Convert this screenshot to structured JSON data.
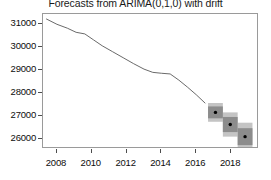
{
  "chart_data": {
    "type": "line",
    "title": "Forecasts from ARIMA(0,1,0) with drift",
    "xlabel": "",
    "ylabel": "",
    "xlim": [
      2007.2,
      2019.6
    ],
    "ylim": [
      25550,
      31450
    ],
    "grid": false,
    "legend": null,
    "xticks": [
      2008,
      2010,
      2012,
      2014,
      2016,
      2018
    ],
    "xtick_labels": [
      "2008",
      "2010",
      "2012",
      "2014",
      "2016",
      "2018"
    ],
    "yticks": [
      26000,
      27000,
      28000,
      29000,
      30000,
      31000
    ],
    "ytick_labels": [
      "26000",
      "27000",
      "28000",
      "29000",
      "30000",
      "31000"
    ],
    "series": [
      {
        "name": "historical",
        "type": "line",
        "color": "#595959",
        "x": [
          2007.4,
          2008.0,
          2008.6,
          2009.1,
          2009.6,
          2010.1,
          2010.6,
          2011.2,
          2011.8,
          2012.4,
          2013.0,
          2013.5,
          2014.0,
          2014.5,
          2015.0,
          2015.5,
          2016.0,
          2016.5
        ],
        "y": [
          31230,
          31000,
          30830,
          30650,
          30580,
          30320,
          30060,
          29800,
          29540,
          29280,
          29040,
          28900,
          28860,
          28830,
          28560,
          28250,
          27920,
          27560
        ]
      },
      {
        "name": "point-forecast",
        "type": "scatter",
        "color": "#000000",
        "x": [
          2017.1,
          2017.95,
          2018.8
        ],
        "y": [
          27150,
          26620,
          26090
        ]
      }
    ],
    "intervals": [
      {
        "name": "80% prediction interval",
        "level": 80,
        "color": "#8c8c8c",
        "x": [
          2017.1,
          2017.95,
          2018.8
        ],
        "lower": [
          26890,
          26290,
          25720
        ],
        "upper": [
          27410,
          26950,
          26460
        ]
      },
      {
        "name": "95% prediction interval",
        "level": 95,
        "color": "#c4c4c4",
        "x": [
          2017.1,
          2017.95,
          2018.8
        ],
        "lower": [
          26740,
          26090,
          25480
        ],
        "upper": [
          27560,
          27150,
          26700
        ]
      }
    ]
  },
  "style": {
    "frame_color": "#9a9a9a",
    "tick_color": "#4d4d4d",
    "text_color": "#0d0d0d",
    "background": "#ffffff"
  }
}
